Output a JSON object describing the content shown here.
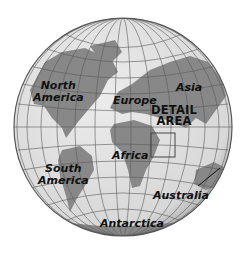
{
  "map": {
    "type": "orthographic globe",
    "colors": {
      "ocean": "#e2e2e2",
      "land": "#888888",
      "graticule": "#5a5a5a",
      "rim": "#555555",
      "label": "#111111"
    },
    "labels": {
      "north_america_1": "North",
      "north_america_2": "America",
      "europe": "Europe",
      "asia": "Asia",
      "detail_1": "DETAIL",
      "detail_2": "AREA",
      "africa": "Africa",
      "south_america_1": "South",
      "south_america_2": "America",
      "australia": "Australia",
      "antarctica": "Antarctica"
    },
    "detail_box": {
      "x": 151,
      "y": 133,
      "width": 24,
      "height": 24
    }
  }
}
